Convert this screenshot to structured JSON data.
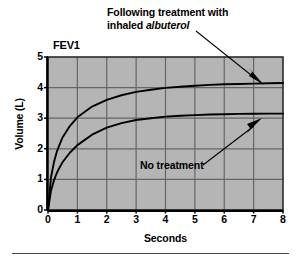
{
  "figure": {
    "plot_title_inset": "FEV1",
    "annotations": [
      {
        "name": "albuterol-annotation",
        "line1": "Following treatment with",
        "line2_prefix": "inhaled ",
        "line2_italic": "albuterol",
        "target_curve": "post-albuterol"
      },
      {
        "name": "no-treatment-annotation",
        "text": "No treatment",
        "target_curve": "no-treatment"
      }
    ]
  },
  "chart_data": {
    "type": "line",
    "title": "FEV1",
    "xlabel": "Seconds",
    "ylabel": "Volume (L)",
    "xlim": [
      0,
      8
    ],
    "ylim": [
      0,
      5
    ],
    "xticks": [
      "0",
      "1",
      "2",
      "3",
      "4",
      "5",
      "6",
      "7",
      "8"
    ],
    "yticks": [
      "5",
      "4",
      "3",
      "2",
      "1",
      "0"
    ],
    "grid": true,
    "grid_x_step": 1,
    "grid_y_step": 1,
    "legend_position": "inline-annotations",
    "plot_background": "#b5b5b5",
    "grid_color": "#666666",
    "curve_color": "#000000",
    "x": [
      0,
      0.1,
      0.2,
      0.3,
      0.4,
      0.5,
      0.75,
      1,
      1.5,
      2,
      2.5,
      3,
      3.5,
      4,
      4.5,
      5,
      5.5,
      6,
      6.5,
      7,
      7.5,
      8
    ],
    "series": [
      {
        "name": "Following treatment with inhaled albuterol",
        "label": "post-albuterol",
        "plateau": 4.15,
        "values": [
          0,
          1.05,
          1.55,
          1.9,
          2.15,
          2.38,
          2.75,
          3.03,
          3.38,
          3.6,
          3.75,
          3.86,
          3.93,
          3.99,
          4.03,
          4.06,
          4.09,
          4.11,
          4.12,
          4.13,
          4.14,
          4.15
        ]
      },
      {
        "name": "No treatment",
        "label": "no-treatment",
        "plateau": 3.15,
        "values": [
          0,
          0.62,
          0.96,
          1.21,
          1.4,
          1.57,
          1.88,
          2.12,
          2.46,
          2.69,
          2.84,
          2.94,
          3.0,
          3.05,
          3.08,
          3.1,
          3.12,
          3.13,
          3.14,
          3.145,
          3.148,
          3.15
        ]
      }
    ]
  }
}
